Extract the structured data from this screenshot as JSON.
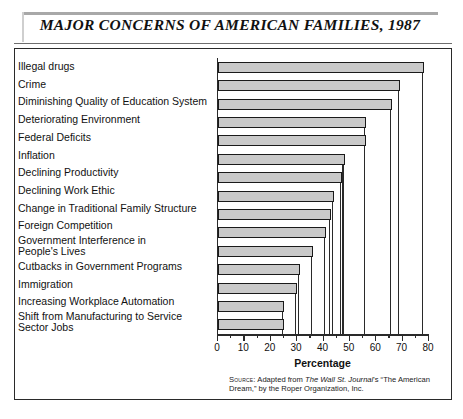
{
  "title": "MAJOR CONCERNS OF AMERICAN FAMILIES, 1987",
  "source": {
    "prefix": "Source:",
    "text_before_italic": " Adapted from ",
    "italic": "The Wall St. Journal",
    "text_after_italic": "'s “The American Dream,” by the Roper Organization, Inc."
  },
  "chart_data": {
    "type": "bar",
    "orientation": "horizontal",
    "title": "MAJOR CONCERNS OF AMERICAN FAMILIES, 1987",
    "xlabel": "Percentage",
    "ylabel": "",
    "xlim": [
      0,
      80
    ],
    "xticks": [
      0,
      10,
      20,
      30,
      40,
      50,
      60,
      70,
      80
    ],
    "xminor_ticks": [
      5,
      15,
      25,
      35,
      45,
      55,
      65,
      75
    ],
    "grid": false,
    "legend": false,
    "bar_color": "#c9c9c9",
    "bar_edge_color": "#1a1a1a",
    "categories": [
      "Illegal drugs",
      "Crime",
      "Diminishing Quality of Education System",
      "Deteriorating Environment",
      "Federal Deficits",
      "Inflation",
      "Declining Productivity",
      "Declining Work Ethic",
      "Change in Traditional Family Structure",
      "Foreign Competition",
      "Government Interference in\nPeople's Lives",
      "Cutbacks in Government Programs",
      "Immigration",
      "Increasing Workplace Automation",
      "Shift from Manufacturing to Service\nSector Jobs"
    ],
    "values": [
      78,
      69,
      66,
      56,
      56,
      48,
      47,
      44,
      43,
      41,
      36,
      31,
      30,
      25,
      25
    ]
  }
}
